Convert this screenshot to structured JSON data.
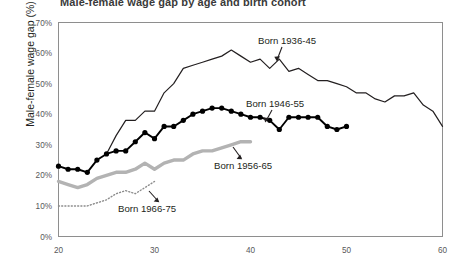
{
  "title_clipped": "Male-female wage gap by age and birth cohort",
  "axes": {
    "ylabel": "Male-female wage gap (%)",
    "xlabel": "",
    "yticks": [
      "0%",
      "10%",
      "20%",
      "30%",
      "40%",
      "50%",
      "60%",
      "70%"
    ],
    "xticks": [
      "20",
      "30",
      "40",
      "50",
      "60"
    ]
  },
  "annotations": {
    "born_1936_45": "Born 1936-45",
    "born_1946_55": "Born 1946-55",
    "born_1956_65": "Born 1956-65",
    "born_1966_75": "Born 1966-75"
  },
  "colors": {
    "line_1936_45": "#231f20",
    "line_1946_55": "#000000",
    "line_1956_65": "#b3b3b3",
    "line_1966_75": "#8c8c8c",
    "axis": "#8e8e8e",
    "tick_text": "#58585a"
  },
  "chart_data": {
    "type": "line",
    "title": "Male-female wage gap by age and birth cohort",
    "xlabel": "",
    "ylabel": "Male-female wage gap (%)",
    "xlim": [
      20,
      60
    ],
    "ylim": [
      0,
      70
    ],
    "xticks": [
      20,
      30,
      40,
      50,
      60
    ],
    "yticks": [
      0,
      10,
      20,
      30,
      40,
      50,
      60,
      70
    ],
    "grid": false,
    "legend": "annotated-inline",
    "series": [
      {
        "name": "Born 1936-45",
        "style": "thin-solid-black",
        "x": [
          25,
          26,
          27,
          28,
          29,
          30,
          31,
          32,
          33,
          34,
          35,
          36,
          37,
          38,
          39,
          40,
          41,
          42,
          43,
          44,
          45,
          46,
          47,
          48,
          49,
          50,
          51,
          52,
          53,
          54,
          55,
          56,
          57,
          58,
          59,
          60
        ],
        "y": [
          27,
          33,
          38,
          38,
          41,
          41,
          47,
          50,
          55,
          56,
          57,
          58,
          59,
          61,
          59,
          57,
          58,
          55,
          58,
          54,
          55,
          53,
          51,
          51,
          50,
          49,
          47,
          47,
          45,
          44,
          46,
          46,
          47,
          43,
          41,
          36
        ]
      },
      {
        "name": "Born 1946-55",
        "style": "thick-black-with-markers",
        "x": [
          20,
          21,
          22,
          23,
          24,
          25,
          26,
          27,
          28,
          29,
          30,
          31,
          32,
          33,
          34,
          35,
          36,
          37,
          38,
          39,
          40,
          41,
          42,
          43,
          44,
          45,
          46,
          47,
          48,
          49,
          50
        ],
        "y": [
          23,
          22,
          22,
          21,
          25,
          27,
          28,
          28,
          31,
          34,
          32,
          36,
          36,
          38,
          40,
          41,
          42,
          42,
          41,
          40,
          39,
          39,
          38,
          35,
          39,
          39,
          39,
          39,
          36,
          35,
          36
        ]
      },
      {
        "name": "Born 1956-65",
        "style": "thick-gray",
        "x": [
          20,
          21,
          22,
          23,
          24,
          25,
          26,
          27,
          28,
          29,
          30,
          31,
          32,
          33,
          34,
          35,
          36,
          37,
          38,
          39,
          40
        ],
        "y": [
          18,
          17,
          16,
          17,
          19,
          20,
          21,
          21,
          22,
          24,
          22,
          24,
          25,
          25,
          27,
          28,
          28,
          29,
          30,
          31,
          31
        ]
      },
      {
        "name": "Born 1966-75",
        "style": "dotted-gray",
        "x": [
          20,
          21,
          22,
          23,
          24,
          25,
          26,
          27,
          28,
          29,
          30
        ],
        "y": [
          10,
          10,
          10,
          10,
          11,
          12,
          14,
          15,
          14,
          16,
          18
        ]
      }
    ]
  }
}
